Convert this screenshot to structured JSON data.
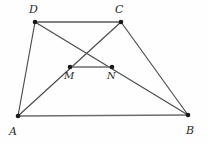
{
  "figure": {
    "name": "trapezoid-with-midsegment",
    "background_color": "#fefefe",
    "line_color": "#4a4a4a",
    "vertex_color": "#1a1a1a",
    "label_color": "#2b2b2b",
    "width": 209,
    "height": 145
  },
  "points": {
    "D": {
      "label": "D",
      "x": 35,
      "y": 22,
      "label_x": 29,
      "label_y": 4
    },
    "C": {
      "label": "C",
      "x": 121,
      "y": 22,
      "label_x": 115,
      "label_y": 4
    },
    "A": {
      "label": "A",
      "x": 18,
      "y": 116,
      "label_x": 9,
      "label_y": 126
    },
    "B": {
      "label": "B",
      "x": 188,
      "y": 115,
      "label_x": 186,
      "label_y": 125
    },
    "M": {
      "label": "M",
      "x": 70,
      "y": 67,
      "label_x": 64,
      "label_y": 71
    },
    "N": {
      "label": "N",
      "x": 112,
      "y": 67,
      "label_x": 107,
      "label_y": 71
    }
  },
  "segments": [
    {
      "name": "segment-DC",
      "from": "D",
      "to": "C",
      "style": "top-edge"
    },
    {
      "name": "segment-AB",
      "from": "A",
      "to": "B",
      "style": "base-edge"
    },
    {
      "name": "segment-AD",
      "from": "A",
      "to": "D",
      "style": "side-edge"
    },
    {
      "name": "segment-CB",
      "from": "C",
      "to": "B",
      "style": "side-edge"
    },
    {
      "name": "segment-AC",
      "from": "A",
      "to": "C",
      "style": "diagonal-edge"
    },
    {
      "name": "segment-DB",
      "from": "D",
      "to": "B",
      "style": "diagonal-edge"
    },
    {
      "name": "segment-MN",
      "from": "M",
      "to": "N",
      "style": "mid-edge"
    }
  ],
  "vertex_radius": 2.3
}
